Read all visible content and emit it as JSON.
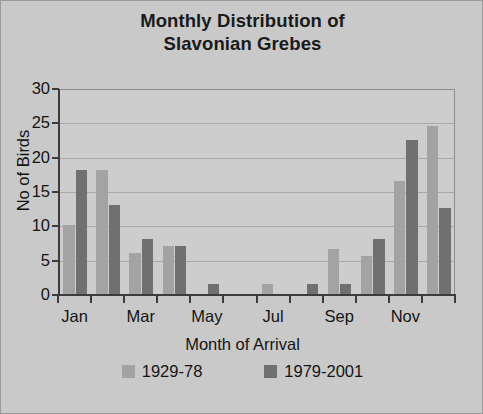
{
  "chart_data": {
    "type": "bar",
    "title": "Monthly Distribution of Slavonian Grebes",
    "title_lines": [
      "Monthly Distribution of",
      "Slavonian Grebes"
    ],
    "xlabel": "Month of Arrival",
    "ylabel": "No of Birds",
    "ylim": [
      0,
      30
    ],
    "ytick_step": 5,
    "yticks": [
      30,
      25,
      20,
      15,
      10,
      5,
      0
    ],
    "grid": true,
    "grid_axis": "y",
    "legend_position": "bottom",
    "categories": [
      "Jan",
      "Feb",
      "Mar",
      "Apr",
      "May",
      "Jun",
      "Jul",
      "Aug",
      "Sep",
      "Oct",
      "Nov",
      "Dec"
    ],
    "xtick_labels": [
      "Jan",
      "",
      "Mar",
      "",
      "May",
      "",
      "Jul",
      "",
      "Sep",
      "",
      "Nov",
      ""
    ],
    "series": [
      {
        "name": "1929-78",
        "color": "#a3a3a3",
        "values": [
          10,
          18,
          6,
          7,
          0,
          0,
          1.5,
          0,
          6.5,
          5.5,
          16.5,
          24.5
        ]
      },
      {
        "name": "1979-2001",
        "color": "#707070",
        "values": [
          18,
          13,
          8,
          7,
          1.5,
          0,
          0,
          1.5,
          1.5,
          8,
          22.5,
          12.5
        ]
      }
    ]
  },
  "legend": {
    "items": [
      {
        "label": "1929-78",
        "color": "#a3a3a3"
      },
      {
        "label": "1979-2001",
        "color": "#707070"
      }
    ]
  },
  "colors": {
    "background": "#c9c9c9",
    "plot_background": "#cdcdcd",
    "axis": "#3c3c3c",
    "gridline": "#a8a8a8",
    "text": "#141414",
    "series_1929_78": "#a3a3a3",
    "series_1979_2001": "#707070"
  }
}
